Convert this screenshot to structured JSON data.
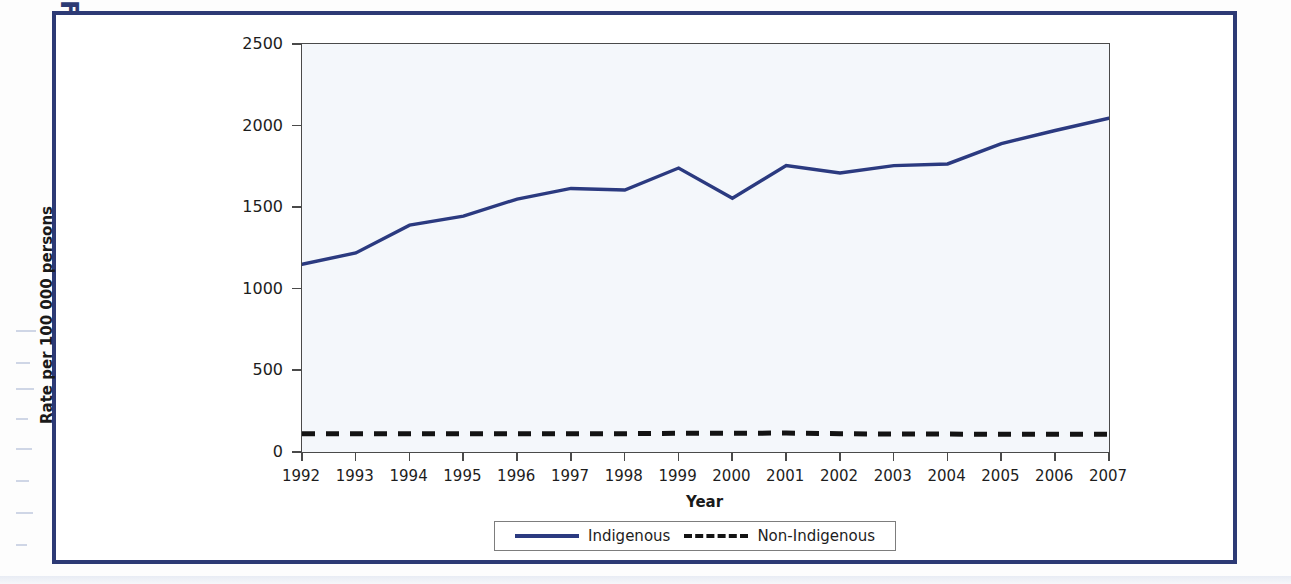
{
  "figure": {
    "label": "FIGURE 13.12"
  },
  "colors": {
    "frame_border": "#2d3a75",
    "indigenous_line": "#2b3a80",
    "non_indigenous_line": "#131313",
    "plot_background": "#f4f7fb",
    "axis": "#4a4a4a"
  },
  "legend": {
    "position": "bottom-center",
    "entries": [
      {
        "label": "Indigenous",
        "style": "solid",
        "color": "#2b3a80"
      },
      {
        "label": "Non-Indigenous",
        "style": "dashed",
        "color": "#131313"
      }
    ]
  },
  "chart_data": {
    "type": "line",
    "title": "",
    "subtitle": "",
    "xlabel": "Year",
    "ylabel": "Rate per 100 000 persons",
    "grid": false,
    "xlim": [
      1992,
      2007
    ],
    "ylim": [
      0,
      2500
    ],
    "ytick_labels": [
      "0",
      "500",
      "1000",
      "1500",
      "2000",
      "2500"
    ],
    "yticks": [
      0,
      500,
      1000,
      1500,
      2000,
      2500
    ],
    "x": [
      1992,
      1993,
      1994,
      1995,
      1996,
      1997,
      1998,
      1999,
      2000,
      2001,
      2002,
      2003,
      2004,
      2005,
      2006,
      2007
    ],
    "xtick_labels": [
      "1992",
      "1993",
      "1994",
      "1995",
      "1996",
      "1997",
      "1998",
      "1999",
      "2000",
      "2001",
      "2002",
      "2003",
      "2004",
      "2005",
      "2006",
      "2007"
    ],
    "series": [
      {
        "name": "Indigenous",
        "style": "solid",
        "color": "#2b3a80",
        "values": [
          1150,
          1220,
          1390,
          1445,
          1550,
          1615,
          1605,
          1740,
          1555,
          1755,
          1710,
          1755,
          1765,
          1890,
          1970,
          2045
        ]
      },
      {
        "name": "Non-Indigenous",
        "style": "dashed",
        "color": "#131313",
        "values": [
          112,
          112,
          112,
          112,
          112,
          112,
          112,
          115,
          115,
          116,
          112,
          110,
          110,
          108,
          108,
          108
        ]
      }
    ],
    "annotations": []
  }
}
